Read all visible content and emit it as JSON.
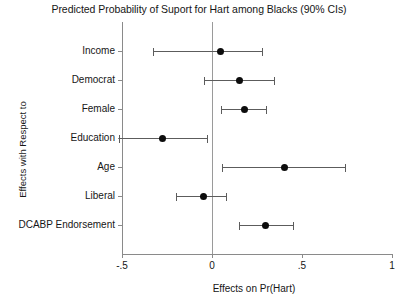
{
  "chart_data": {
    "type": "scatter",
    "subtype": "coefficient-plot-with-error-bars",
    "title": "Predicted Probability of Suport for Hart among Blacks (90% CIs)",
    "xlabel": "Effects on Pr(Hart)",
    "ylabel": "Effects with Respect to",
    "xlim": [
      -0.5,
      1.0
    ],
    "xticks": [
      -0.5,
      0,
      0.5,
      1
    ],
    "xticklabels": [
      "-.5",
      "0",
      ".5",
      "1"
    ],
    "grid": false,
    "legend": false,
    "reference_line": 0,
    "categories": [
      "Income",
      "Democrat",
      "Female",
      "Education",
      "Age",
      "Liberal",
      "DCABP Endorsement"
    ],
    "points": [
      {
        "label": "Income",
        "estimate": 0.045,
        "ci_low": -0.33,
        "ci_high": 0.28
      },
      {
        "label": "Democrat",
        "estimate": 0.155,
        "ci_low": -0.045,
        "ci_high": 0.345
      },
      {
        "label": "Female",
        "estimate": 0.18,
        "ci_low": 0.05,
        "ci_high": 0.3
      },
      {
        "label": "Education",
        "estimate": -0.275,
        "ci_low": -0.515,
        "ci_high": -0.03
      },
      {
        "label": "Age",
        "estimate": 0.4,
        "ci_low": 0.055,
        "ci_high": 0.74
      },
      {
        "label": "Liberal",
        "estimate": -0.045,
        "ci_low": -0.2,
        "ci_high": 0.08
      },
      {
        "label": "DCABP Endorsement",
        "estimate": 0.295,
        "ci_low": 0.15,
        "ci_high": 0.45
      }
    ],
    "colors": {
      "point": "#0d0d0d",
      "error_bar": "#5c5c5c",
      "axis": "#8a8a8a",
      "reference_line": "#9a9a9a",
      "text": "#161616",
      "background": "#ffffff"
    }
  }
}
